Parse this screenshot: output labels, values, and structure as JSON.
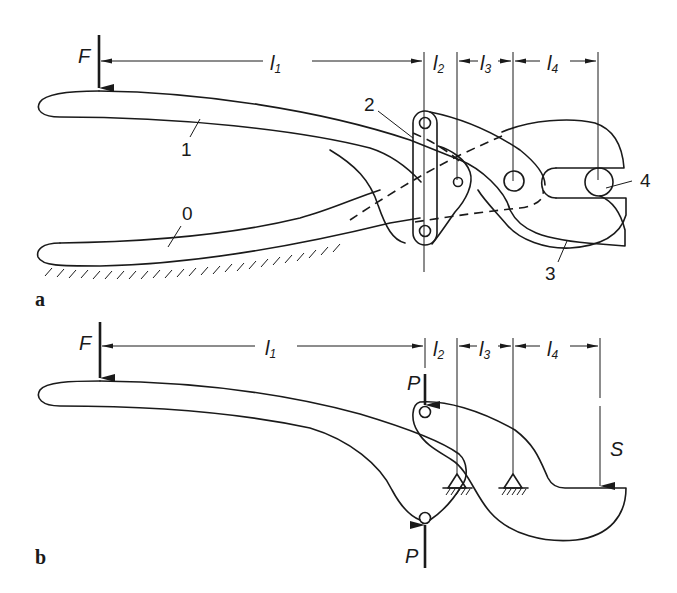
{
  "figure": {
    "panels": [
      {
        "id": "a",
        "label": "a",
        "description": "Compound cutting pliers (toggle-lever linkage)",
        "force_label": "F",
        "dimensions": [
          {
            "symbol": "l",
            "sub": "1"
          },
          {
            "symbol": "l",
            "sub": "2"
          },
          {
            "symbol": "l",
            "sub": "3"
          },
          {
            "symbol": "l",
            "sub": "4"
          }
        ],
        "part_labels": [
          "1",
          "0",
          "2",
          "3",
          "4"
        ]
      },
      {
        "id": "b",
        "label": "b",
        "description": "Equivalent lever system",
        "force_label": "F",
        "pin_force_label": "P",
        "output_force_label": "S",
        "dimensions": [
          {
            "symbol": "l",
            "sub": "1"
          },
          {
            "symbol": "l",
            "sub": "2"
          },
          {
            "symbol": "l",
            "sub": "3"
          },
          {
            "symbol": "l",
            "sub": "4"
          }
        ]
      }
    ]
  },
  "labels": {
    "a_F": "F",
    "a_l": "l",
    "a_s1": "1",
    "a_s2": "2",
    "a_s3": "3",
    "a_s4": "4",
    "a_part1": "1",
    "a_part0": "0",
    "a_part2": "2",
    "a_part3": "3",
    "a_part4": "4",
    "a_panel": "a",
    "b_F": "F",
    "b_l": "l",
    "b_s1": "1",
    "b_s2": "2",
    "b_s3": "3",
    "b_s4": "4",
    "b_P_top": "P",
    "b_P_bottom": "P",
    "b_S": "S",
    "b_panel": "b"
  },
  "colors": {
    "ink": "#1a1a1a",
    "paper": "#ffffff"
  }
}
